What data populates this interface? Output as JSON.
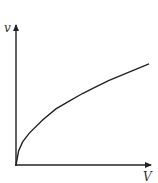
{
  "chart_data": {
    "type": "line",
    "title": "",
    "xlabel": "V",
    "ylabel": "v",
    "xlim": [
      0,
      1
    ],
    "ylim": [
      0,
      1
    ],
    "grid": false,
    "legend": "none",
    "series": [
      {
        "name": "v vs V",
        "shape": "square-root (concave, increasing from origin)",
        "x": [
          0,
          0.02,
          0.05,
          0.1,
          0.2,
          0.3,
          0.4,
          0.5,
          0.6,
          0.7,
          0.8,
          0.9,
          1.0
        ],
        "y": [
          0,
          0.13,
          0.21,
          0.29,
          0.41,
          0.51,
          0.58,
          0.65,
          0.71,
          0.77,
          0.82,
          0.87,
          0.92
        ]
      }
    ],
    "colors": {
      "axis": "#222222",
      "curve": "#222222",
      "label": "#333333"
    }
  }
}
